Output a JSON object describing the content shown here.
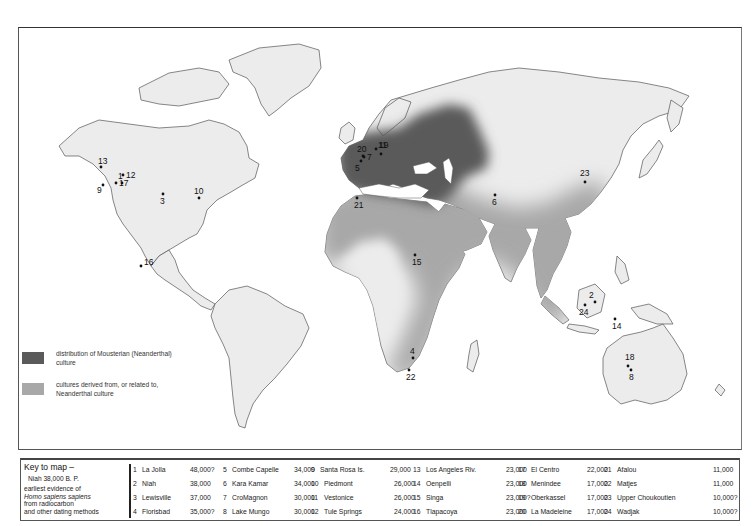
{
  "legend": {
    "items": [
      {
        "label": "distribution of Mousterian (Neanderthal) culture",
        "color": "#5a5a5a"
      },
      {
        "label": "cultures derived from, or related to, Neanderthal culture",
        "color": "#a8a8a8"
      }
    ]
  },
  "key": {
    "title": "Key to map –",
    "sample": "Niah  38,000  B. P.",
    "desc_line1": "earliest evidence of",
    "desc_line2": "Homo sapiens sapiens",
    "desc_line3": "from radiocarbon",
    "desc_line4": "and other dating methods",
    "sites": [
      {
        "num": "1",
        "name": "La Jolla",
        "date": "48,000?"
      },
      {
        "num": "2",
        "name": "Niah",
        "date": "38,000"
      },
      {
        "num": "3",
        "name": "Lewisville",
        "date": "37,000"
      },
      {
        "num": "4",
        "name": "Florisbad",
        "date": "35,000?"
      },
      {
        "num": "5",
        "name": "Combe Capelle",
        "date": "34,000"
      },
      {
        "num": "6",
        "name": "Kara Kamar",
        "date": "34,000"
      },
      {
        "num": "7",
        "name": "CroMagnon",
        "date": "30,000"
      },
      {
        "num": "8",
        "name": "Lake Mungo",
        "date": "30,000"
      },
      {
        "num": "9",
        "name": "Santa Rosa Is.",
        "date": "29,000"
      },
      {
        "num": "10",
        "name": "Piedmont",
        "date": "26,000"
      },
      {
        "num": "11",
        "name": "Vestonice",
        "date": "26,000"
      },
      {
        "num": "12",
        "name": "Tule Springs",
        "date": "24,000"
      },
      {
        "num": "13",
        "name": "Los Angeles Riv.",
        "date": "23,000"
      },
      {
        "num": "14",
        "name": "Oenpelli",
        "date": "23,000"
      },
      {
        "num": "15",
        "name": "Singa",
        "date": "23,000?"
      },
      {
        "num": "16",
        "name": "Tlapacoya",
        "date": "23,000"
      },
      {
        "num": "17",
        "name": "El Centro",
        "date": "22,000"
      },
      {
        "num": "18",
        "name": "Menindee",
        "date": "17,000"
      },
      {
        "num": "19",
        "name": "Oberkassel",
        "date": "17,000"
      },
      {
        "num": "20",
        "name": "La Madeleine",
        "date": "17,000"
      },
      {
        "num": "21",
        "name": "Afalou",
        "date": "11,000"
      },
      {
        "num": "22",
        "name": "Matjes",
        "date": "11,000"
      },
      {
        "num": "23",
        "name": "Upper Choukoutien",
        "date": "10,000?"
      },
      {
        "num": "24",
        "name": "Wadjak",
        "date": "10,000?"
      }
    ]
  },
  "map_markers": [
    {
      "num": "1",
      "region": "California"
    },
    {
      "num": "2",
      "region": "Borneo"
    },
    {
      "num": "3",
      "region": "Texas"
    },
    {
      "num": "4",
      "region": "South Africa"
    },
    {
      "num": "5",
      "region": "France"
    },
    {
      "num": "6",
      "region": "Central Asia"
    },
    {
      "num": "7",
      "region": "France"
    },
    {
      "num": "8",
      "region": "SE Australia"
    },
    {
      "num": "9",
      "region": "California coast"
    },
    {
      "num": "10",
      "region": "Eastern USA"
    },
    {
      "num": "11",
      "region": "Central Europe"
    },
    {
      "num": "12",
      "region": "Nevada"
    },
    {
      "num": "13",
      "region": "California"
    },
    {
      "num": "14",
      "region": "Northern Australia"
    },
    {
      "num": "15",
      "region": "Sudan"
    },
    {
      "num": "16",
      "region": "Mexico"
    },
    {
      "num": "17",
      "region": "California"
    },
    {
      "num": "18",
      "region": "SE Australia"
    },
    {
      "num": "19",
      "region": "Germany"
    },
    {
      "num": "20",
      "region": "France"
    },
    {
      "num": "21",
      "region": "Algeria"
    },
    {
      "num": "22",
      "region": "South Africa"
    },
    {
      "num": "23",
      "region": "North China"
    },
    {
      "num": "24",
      "region": "Java"
    }
  ]
}
